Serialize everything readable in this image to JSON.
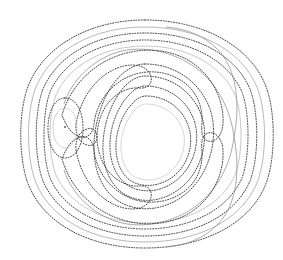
{
  "figure": {
    "title": "",
    "background_color": "#ffffff",
    "width": 283,
    "height": 260,
    "has_axes": false,
    "has_legend": false,
    "has_tick_labels": false,
    "has_annotations": false
  },
  "chart_data": {
    "type": "line",
    "subtype": "contour",
    "title": "",
    "subtitle": "",
    "xlabel": "",
    "ylabel": "",
    "xlim": [
      18,
      272
    ],
    "ylim": [
      20,
      248
    ],
    "grid": false,
    "legend_position": "none",
    "tick_labels_x": [],
    "tick_labels_y": [],
    "legend_entries": [],
    "annotations": [],
    "colors": {
      "dotted_contour": "#2b2b2b",
      "solid_contour": "#8d8d8d",
      "faint_contour": "#b4b4b4",
      "marker": "#555555",
      "background": "#ffffff"
    },
    "center_of_symmetry": [
      145,
      134
    ],
    "critical_points": [
      {
        "name": "center-vortex",
        "x": 145,
        "y": 137,
        "kind": "center"
      },
      {
        "name": "saddle-point",
        "x": 234,
        "y": 137,
        "kind": "saddle"
      },
      {
        "name": "left-extremum",
        "x": 65,
        "y": 127,
        "kind": "extremum",
        "marker": "dot"
      }
    ],
    "series": [
      {
        "name": "outer-ring-1",
        "style": "dotted",
        "level": 1
      },
      {
        "name": "outer-ring-2",
        "style": "solid",
        "level": 2
      },
      {
        "name": "outer-ring-3",
        "style": "dotted",
        "level": 3
      },
      {
        "name": "outer-ring-4",
        "style": "dotted",
        "level": 4
      },
      {
        "name": "separatrix-lobe",
        "style": "solid",
        "level": 5
      },
      {
        "name": "hook-upper",
        "style": "dotted",
        "level": 6
      },
      {
        "name": "hook-lower",
        "style": "dotted",
        "level": 6
      },
      {
        "name": "crescent-upper",
        "style": "dotted",
        "level": 7
      },
      {
        "name": "crescent-lower",
        "style": "dotted",
        "level": 7
      },
      {
        "name": "inner-oval-1",
        "style": "dotted",
        "level": 8
      },
      {
        "name": "inner-oval-2",
        "style": "dotted",
        "level": 9
      },
      {
        "name": "inner-oval-3",
        "style": "dotted",
        "level": 10
      },
      {
        "name": "left-closed-loop",
        "style": "dotted",
        "level": 11
      }
    ]
  }
}
